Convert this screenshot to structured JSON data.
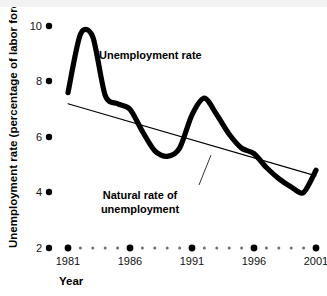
{
  "chart_data": {
    "type": "line",
    "title": "",
    "xlabel": "Year",
    "ylabel": "Unemployment rate (percentage of labor force)",
    "xlim": [
      1980,
      2001
    ],
    "ylim": [
      2,
      10
    ],
    "grid": false,
    "legend": "none",
    "y_ticks": [
      "10",
      "8",
      "6",
      "4",
      "2"
    ],
    "y_tick_values": [
      10,
      8,
      6,
      4,
      2
    ],
    "x_ticks": [
      "1981",
      "1986",
      "1991",
      "1996",
      "2001"
    ],
    "x_tick_values": [
      1981,
      1986,
      1991,
      1996,
      2001
    ],
    "x_minor_tick_count_between": 4,
    "series": [
      {
        "name": "Unemployment rate",
        "style": "thick-black-curve",
        "x": [
          1981,
          1982,
          1983,
          1984,
          1985,
          1986,
          1987,
          1988,
          1989,
          1990,
          1991,
          1992,
          1993,
          1994,
          1995,
          1996,
          1997,
          1998,
          1999,
          2000,
          2001
        ],
        "values": [
          7.6,
          9.7,
          9.6,
          7.5,
          7.2,
          7.0,
          6.2,
          5.5,
          5.3,
          5.6,
          6.8,
          7.4,
          6.8,
          6.1,
          5.6,
          5.4,
          4.9,
          4.5,
          4.2,
          4.0,
          4.8
        ]
      },
      {
        "name": "Natural rate of unemployment",
        "style": "thin-straight-line",
        "x": [
          1981,
          2001
        ],
        "values": [
          7.2,
          4.6
        ]
      }
    ],
    "annotations": [
      {
        "text": "Unemployment rate",
        "x": 1985.0,
        "y": 8.6
      },
      {
        "text_line1": "Natural rate of",
        "text_line2": "unemployment",
        "x": 1988.6,
        "y": 3.9,
        "leader_to_x": 1991.6,
        "leader_to_y": 5.6
      }
    ]
  },
  "axis": {
    "y_title": "Unemployment rate (percentage of labor force)",
    "x_title": "Year",
    "y_tick_10": "10",
    "y_tick_8": "8",
    "y_tick_6": "6",
    "y_tick_4": "4",
    "y_tick_2": "2",
    "x_tick_1981": "1981",
    "x_tick_1986": "1986",
    "x_tick_1991": "1991",
    "x_tick_1996": "1996",
    "x_tick_2001": "2001"
  },
  "labels": {
    "unemployment_rate": "Unemployment rate",
    "natural_rate_line1": "Natural rate of",
    "natural_rate_line2": "unemployment"
  },
  "colors": {
    "ink": "#000000",
    "minor_dot": "#6f6f6f",
    "background": "#ffffff",
    "top_band": "#f2f2f2"
  }
}
